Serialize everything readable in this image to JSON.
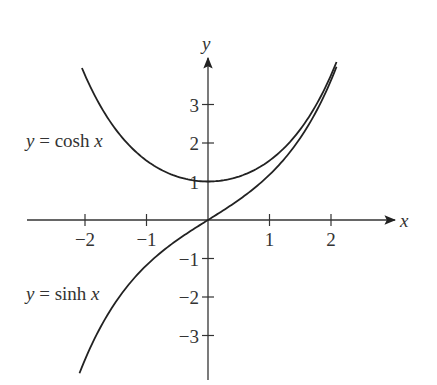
{
  "chart_data": {
    "type": "line",
    "title": "",
    "xlabel": "x",
    "ylabel": "y",
    "xlim": [
      -2.9,
      3.0
    ],
    "ylim": [
      -4.0,
      4.3
    ],
    "grid": false,
    "legend": "inline labels on left",
    "x_ticks": [
      -2,
      -1,
      1,
      2
    ],
    "x_tick_labels": [
      "−2",
      "−1",
      "1",
      "2"
    ],
    "y_ticks": [
      3,
      2,
      1,
      -1,
      -2,
      -3
    ],
    "y_tick_labels": [
      "3",
      "2",
      "1",
      "−1",
      "−2",
      "−3"
    ],
    "series": [
      {
        "name": "y = cosh x",
        "label_prefix": "y",
        "label_func": " = cosh ",
        "label_var": "x",
        "x": [
          -2.05,
          -1.5,
          -1,
          -0.5,
          0,
          0.5,
          1,
          1.5,
          2.09
        ],
        "values": [
          3.95,
          2.35,
          1.54,
          1.13,
          1.0,
          1.13,
          1.54,
          2.35,
          4.1
        ]
      },
      {
        "name": "y = sinh x",
        "label_prefix": "y",
        "label_func": " = sinh ",
        "label_var": "x",
        "x": [
          -2.09,
          -1.5,
          -1,
          -0.5,
          0,
          0.5,
          1,
          1.5,
          2.09
        ],
        "values": [
          -3.97,
          -2.13,
          -1.18,
          -0.52,
          0,
          0.52,
          1.18,
          2.13,
          3.97
        ]
      }
    ]
  },
  "axes": {
    "x_axis_label": "x",
    "y_axis_label": "y"
  },
  "colors": {
    "curve": "#222222",
    "axis": "#333333",
    "text": "#333333"
  }
}
